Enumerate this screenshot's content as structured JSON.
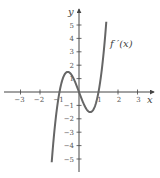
{
  "chart_data": {
    "type": "line",
    "title": "",
    "xlabel": "x",
    "ylabel": "y",
    "xlim": [
      -3.5,
      3.7
    ],
    "ylim": [
      -6,
      6
    ],
    "grid": false,
    "x_ticks": [
      -3,
      -2,
      -1,
      1,
      2,
      3
    ],
    "x_tick_labels": [
      "−3",
      "−2",
      "−1",
      "1",
      "2",
      "3"
    ],
    "y_ticks": [
      -5,
      -4,
      -3,
      -2,
      -1,
      1,
      2,
      3,
      4,
      5
    ],
    "y_tick_labels": [
      "−5",
      "−4",
      "−3",
      "−2",
      "−1",
      "1",
      "2",
      "3",
      "4",
      "5"
    ],
    "series": [
      {
        "name": "f'(x)",
        "label": "f ′(x)",
        "description": "cubic with zeros at x = -1, 0, 1; local max ≈ 1.5 near x ≈ -0.58, local min ≈ -1.5 near x ≈ 0.58",
        "x": [
          -1.4,
          -1.2,
          -1.0,
          -0.8,
          -0.58,
          -0.4,
          -0.2,
          0.0,
          0.2,
          0.4,
          0.58,
          0.8,
          1.0,
          1.2,
          1.4
        ],
        "y": [
          -5.2,
          -2.0,
          0.0,
          1.1,
          1.5,
          1.3,
          0.75,
          0.0,
          -0.75,
          -1.3,
          -1.5,
          -1.1,
          0.0,
          2.0,
          5.2
        ]
      }
    ],
    "annotations": [
      {
        "text": "f ′(x)",
        "x": 1.9,
        "y": 3.1
      }
    ]
  },
  "colors": {
    "axis": "#444444",
    "curve": "#666666",
    "text": "#555555"
  }
}
